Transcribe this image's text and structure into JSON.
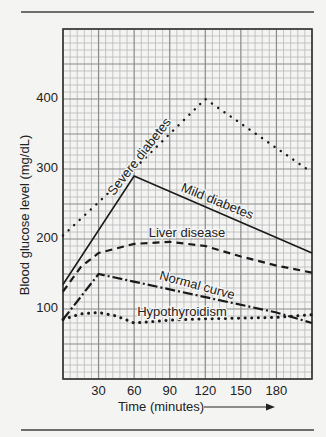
{
  "chart_data": {
    "type": "line",
    "title": "",
    "xlabel": "Time (minutes)",
    "ylabel": "Blood glucose level (mg/dL)",
    "xlim": [
      0,
      210
    ],
    "ylim": [
      0,
      500
    ],
    "x_ticks": [
      30,
      60,
      90,
      120,
      150,
      180
    ],
    "y_ticks": [
      100,
      200,
      300,
      400
    ],
    "grid": true,
    "x_minor_step": 6,
    "y_minor_step": 10,
    "x_major_step": 30,
    "y_major_step": 50,
    "legend_position": "inline labels",
    "series": [
      {
        "name": "Severe diabetes",
        "style": "dotted",
        "points": [
          [
            0,
            205
          ],
          [
            60,
            300
          ],
          [
            120,
            400
          ],
          [
            210,
            295
          ]
        ],
        "label": {
          "x": 140,
          "y": 157,
          "angle": -52
        }
      },
      {
        "name": "Mild diabetes",
        "style": "solid",
        "points": [
          [
            0,
            135
          ],
          [
            60,
            290
          ],
          [
            210,
            180
          ]
        ],
        "label": {
          "x": 217,
          "y": 202,
          "angle": 22
        }
      },
      {
        "name": "Liver disease",
        "style": "dashed",
        "points": [
          [
            0,
            125
          ],
          [
            15,
            160
          ],
          [
            30,
            180
          ],
          [
            60,
            193
          ],
          [
            90,
            196
          ],
          [
            120,
            190
          ],
          [
            150,
            175
          ],
          [
            180,
            162
          ],
          [
            210,
            152
          ]
        ],
        "label": {
          "x": 187,
          "y": 234,
          "angle": 0
        }
      },
      {
        "name": "Normal curve",
        "style": "dash-dot",
        "points": [
          [
            0,
            85
          ],
          [
            30,
            150
          ],
          [
            180,
            95
          ],
          [
            210,
            80
          ]
        ],
        "label": {
          "x": 197,
          "y": 286,
          "angle": 15
        }
      },
      {
        "name": "Hypothyroidism",
        "style": "dotted-heavy",
        "points": [
          [
            0,
            85
          ],
          [
            15,
            93
          ],
          [
            30,
            95
          ],
          [
            45,
            90
          ],
          [
            60,
            80
          ],
          [
            90,
            84
          ],
          [
            120,
            86
          ],
          [
            150,
            87
          ],
          [
            180,
            88
          ],
          [
            210,
            92
          ]
        ],
        "label": {
          "x": 182,
          "y": 313,
          "angle": 0
        }
      }
    ]
  },
  "axis": {
    "x_title": "Time (minutes)",
    "y_title": "Blood glucose level (mg/dL)",
    "arrow": "→"
  }
}
